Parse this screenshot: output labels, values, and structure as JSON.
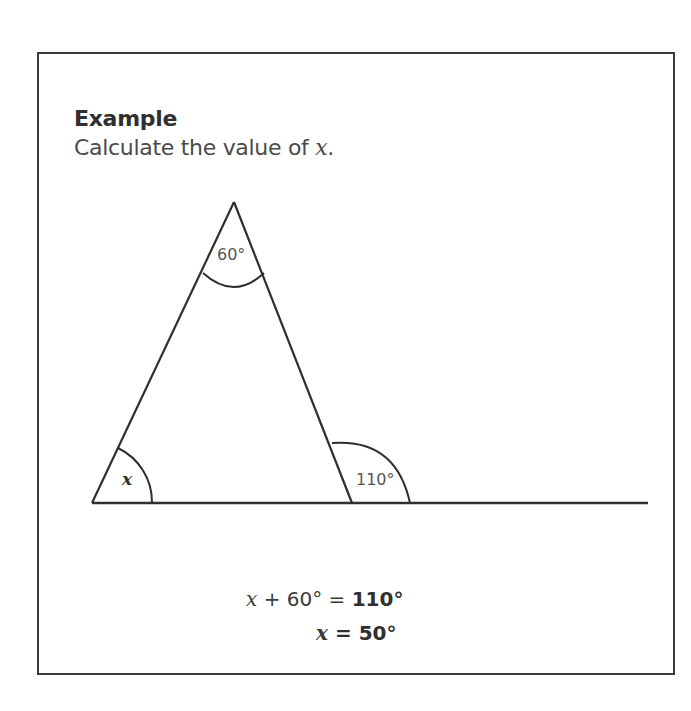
{
  "example": {
    "heading": "Example",
    "prompt_prefix": "Calculate the value of ",
    "prompt_var": "x",
    "prompt_suffix": "."
  },
  "diagram": {
    "type": "triangle-exterior-angle",
    "apex": [
      234,
      202
    ],
    "base_left": [
      92,
      503
    ],
    "base_right": [
      352,
      503
    ],
    "baseline_end": [
      648,
      503
    ],
    "stroke_color": "#2f2f2f",
    "angles": {
      "apex": {
        "label": "60°",
        "value": 60
      },
      "base_left": {
        "label": "x",
        "value": null
      },
      "exterior": {
        "label": "110°",
        "value": 110
      }
    }
  },
  "solution": {
    "line1": {
      "var": "x",
      "lhs_rest": " + 60° = ",
      "rhs": "110°"
    },
    "line2": {
      "var": "x",
      "eq": " = ",
      "rhs": "50°"
    }
  }
}
